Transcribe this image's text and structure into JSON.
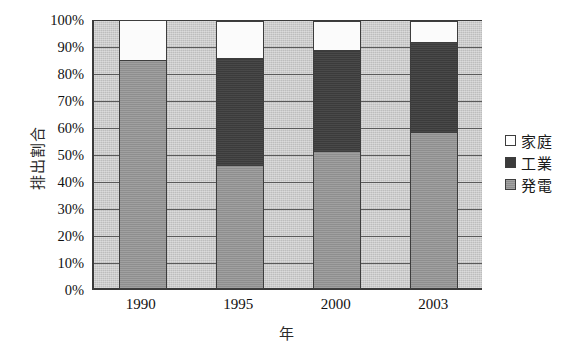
{
  "chart_data": {
    "type": "bar",
    "subtype": "100% stacked column",
    "title": "",
    "xlabel": "年",
    "ylabel": "排出割合",
    "categories": [
      "1990",
      "1995",
      "2000",
      "2003"
    ],
    "ylim": [
      0,
      100
    ],
    "ytick_labels": [
      "100%",
      "90%",
      "80%",
      "70%",
      "60%",
      "50%",
      "40%",
      "30%",
      "20%",
      "10%",
      "0%"
    ],
    "ytick_values": [
      100,
      90,
      80,
      70,
      60,
      50,
      40,
      30,
      20,
      10,
      0
    ],
    "grid": true,
    "legend_position": "right",
    "series": [
      {
        "name": "家庭",
        "color": "#ffffff",
        "values": [
          15,
          14,
          11,
          8
        ]
      },
      {
        "name": "工業",
        "color": "#3b3b3b",
        "values": [
          0,
          40,
          38,
          34
        ]
      },
      {
        "name": "発電",
        "color": "#8e8e8e",
        "values": [
          85,
          46,
          51,
          58
        ]
      }
    ],
    "stack_order_bottom_to_top": [
      "発電",
      "工業",
      "家庭"
    ],
    "plot_background": "#bdbdbd"
  },
  "axes": {
    "y_title": "排出割合",
    "x_title": "年",
    "y_ticks": [
      {
        "label": "100%",
        "value": 100
      },
      {
        "label": "90%",
        "value": 90
      },
      {
        "label": "80%",
        "value": 80
      },
      {
        "label": "70%",
        "value": 70
      },
      {
        "label": "60%",
        "value": 60
      },
      {
        "label": "50%",
        "value": 50
      },
      {
        "label": "40%",
        "value": 40
      },
      {
        "label": "30%",
        "value": 30
      },
      {
        "label": "20%",
        "value": 20
      },
      {
        "label": "10%",
        "value": 10
      },
      {
        "label": "0%",
        "value": 0
      }
    ],
    "x_ticks": [
      "1990",
      "1995",
      "2000",
      "2003"
    ]
  },
  "legend": {
    "items": [
      {
        "label": "家庭",
        "swatch": "household"
      },
      {
        "label": "工業",
        "swatch": "industry"
      },
      {
        "label": "発電",
        "swatch": "power"
      }
    ]
  },
  "colors": {
    "household": "#ffffff",
    "industry": "#3b3b3b",
    "power": "#8e8e8e",
    "plot_bg": "#bdbdbd",
    "axis": "#3a3a3a",
    "gridline": "#5a5a5a"
  }
}
